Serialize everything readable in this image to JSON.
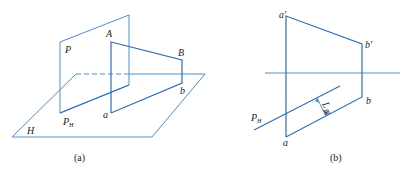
{
  "figure": {
    "panel_a": {
      "caption": "(a)",
      "labels": {
        "P": "P",
        "A": "A",
        "B": "B",
        "b": "b",
        "a": "a",
        "PH_main": "P",
        "PH_sub": "H",
        "H": "H"
      }
    },
    "panel_b": {
      "caption": "(b)",
      "labels": {
        "a_prime": "a′",
        "b_prime": "b′",
        "b": "b",
        "a": "a",
        "PH_main": "P",
        "PH_sub": "H",
        "L_main": "L",
        "L_sub": "距"
      }
    },
    "colors": {
      "line": "#4d8fd0",
      "line_strong": "#2f6fb8",
      "text": "#222222"
    }
  }
}
